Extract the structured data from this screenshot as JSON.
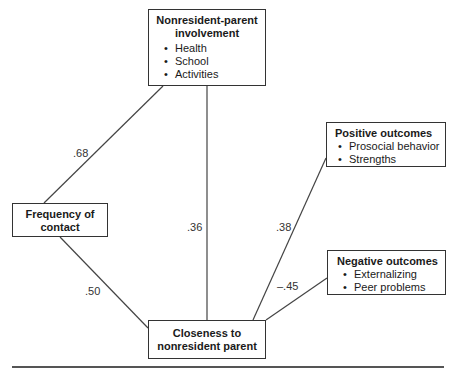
{
  "diagram": {
    "nodes": {
      "involvement": {
        "title_line1": "Nonresident-parent",
        "title_line2": "involvement",
        "items": [
          "Health",
          "School",
          "Activities"
        ]
      },
      "frequency": {
        "title_line1": "Frequency of",
        "title_line2": "contact"
      },
      "closeness": {
        "title_line1": "Closeness to",
        "title_line2": "nonresident parent"
      },
      "positive": {
        "title": "Positive outcomes",
        "items": [
          "Prosocial behavior",
          "Strengths"
        ]
      },
      "negative": {
        "title": "Negative outcomes",
        "items": [
          "Externalizing",
          "Peer problems"
        ]
      }
    },
    "edges": [
      {
        "from": "frequency",
        "to": "involvement",
        "coef": ".68"
      },
      {
        "from": "involvement",
        "to": "closeness",
        "coef": ".36"
      },
      {
        "from": "frequency",
        "to": "closeness",
        "coef": ".50"
      },
      {
        "from": "closeness",
        "to": "positive",
        "coef": ".38"
      },
      {
        "from": "closeness",
        "to": "negative",
        "coef": "–.45"
      }
    ]
  }
}
